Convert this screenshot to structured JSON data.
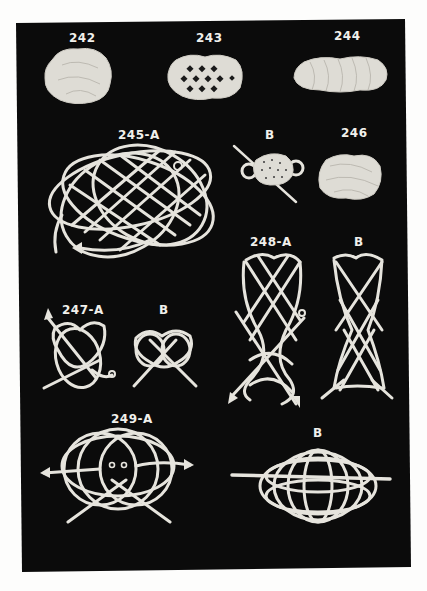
{
  "plate": {
    "background_color": "#0b0b0b",
    "rope_color": "#e6e4dd",
    "figures": [
      {
        "id": "242",
        "label": "242",
        "style": "finished flat mat, rounded"
      },
      {
        "id": "243",
        "label": "243",
        "style": "open oval mat"
      },
      {
        "id": "244",
        "label": "244",
        "style": "elongated flat mat"
      },
      {
        "id": "245-A",
        "label": "245-A",
        "style": "line diagram with arrow"
      },
      {
        "id": "245-B",
        "label": "B",
        "style": "mat with rod and side loops"
      },
      {
        "id": "246",
        "label": "246",
        "style": "finished oval mat"
      },
      {
        "id": "247-A",
        "label": "247-A",
        "style": "line diagram with arrow"
      },
      {
        "id": "247-B",
        "label": "B",
        "style": "finished line diagram"
      },
      {
        "id": "248-A",
        "label": "248-A",
        "style": "tall line diagram with arrows"
      },
      {
        "id": "248-B",
        "label": "B",
        "style": "tall finished line diagram"
      },
      {
        "id": "249-A",
        "label": "249-A",
        "style": "circular line diagram with arrows"
      },
      {
        "id": "249-B",
        "label": "B",
        "style": "finished globe on rod"
      }
    ]
  }
}
